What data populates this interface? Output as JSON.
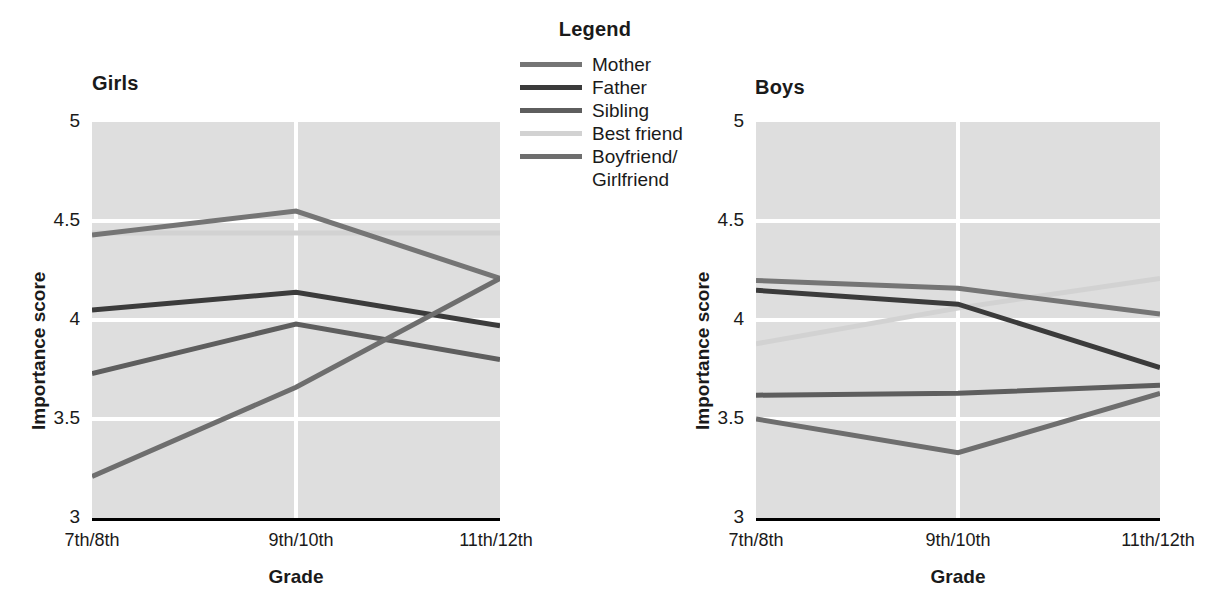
{
  "legend": {
    "title": "Legend",
    "entries": [
      {
        "label": "Mother",
        "color": "#757575"
      },
      {
        "label": "Father",
        "color": "#3b3b3b"
      },
      {
        "label": "Sibling",
        "color": "#5e5e5e"
      },
      {
        "label": "Best friend",
        "color": "#d2d2d2"
      },
      {
        "label": "Boyfriend/",
        "color": "#6e6e6e",
        "label2": "Girlfriend"
      }
    ]
  },
  "panels": [
    {
      "title": "Girls",
      "ylabel": "Importance score",
      "xlabel": "Grade",
      "yticks": [
        "5",
        "4.5",
        "4",
        "3.5",
        "3"
      ],
      "xticks": [
        "7th/8th",
        "9th/10th",
        "11th/12th"
      ]
    },
    {
      "title": "Boys",
      "ylabel": "Importance score",
      "xlabel": "Grade",
      "yticks": [
        "5",
        "4.5",
        "4",
        "3.5",
        "3"
      ],
      "xticks": [
        "7th/8th",
        "9th/10th",
        "11th/12th"
      ]
    }
  ],
  "chart_data": [
    {
      "type": "line",
      "title": "Girls",
      "xlabel": "Grade",
      "ylabel": "Importance score",
      "categories": [
        "7th/8th",
        "9th/10th",
        "11th/12th"
      ],
      "ylim": [
        3,
        5
      ],
      "yticks": [
        3,
        3.5,
        4,
        4.5,
        5
      ],
      "grid": true,
      "legend_position": "top-center-between-panels",
      "series": [
        {
          "name": "Mother",
          "color": "#757575",
          "values": [
            4.43,
            4.55,
            4.21
          ]
        },
        {
          "name": "Father",
          "color": "#3b3b3b",
          "values": [
            4.05,
            4.14,
            3.97
          ]
        },
        {
          "name": "Sibling",
          "color": "#5e5e5e",
          "values": [
            3.73,
            3.98,
            3.8
          ]
        },
        {
          "name": "Best friend",
          "color": "#d2d2d2",
          "values": [
            4.44,
            4.44,
            4.44
          ]
        },
        {
          "name": "Boyfriend/Girlfriend",
          "color": "#6e6e6e",
          "values": [
            3.21,
            3.66,
            4.21
          ]
        }
      ]
    },
    {
      "type": "line",
      "title": "Boys",
      "xlabel": "Grade",
      "ylabel": "Importance score",
      "categories": [
        "7th/8th",
        "9th/10th",
        "11th/12th"
      ],
      "ylim": [
        3,
        5
      ],
      "yticks": [
        3,
        3.5,
        4,
        4.5,
        5
      ],
      "grid": true,
      "legend_position": "top-center-between-panels",
      "series": [
        {
          "name": "Mother",
          "color": "#757575",
          "values": [
            4.2,
            4.16,
            4.03
          ]
        },
        {
          "name": "Father",
          "color": "#3b3b3b",
          "values": [
            4.15,
            4.08,
            3.76
          ]
        },
        {
          "name": "Sibling",
          "color": "#5e5e5e",
          "values": [
            3.62,
            3.63,
            3.67
          ]
        },
        {
          "name": "Best friend",
          "color": "#d2d2d2",
          "values": [
            3.88,
            4.06,
            4.21
          ]
        },
        {
          "name": "Boyfriend/Girlfriend",
          "color": "#6e6e6e",
          "values": [
            3.5,
            3.33,
            3.63
          ]
        }
      ]
    }
  ]
}
